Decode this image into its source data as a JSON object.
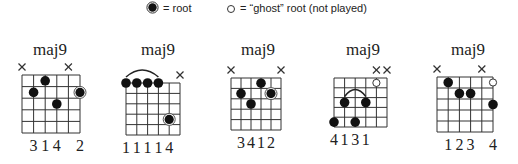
{
  "legend": {
    "root_label": "= root",
    "ghost_label": "= “ghost” root (not played)"
  },
  "chords": [
    {
      "title": "maj9",
      "muted": [
        1,
        5
      ],
      "dots": [
        {
          "string": 2,
          "fret": 2
        },
        {
          "string": 3,
          "fret": 1
        },
        {
          "string": 4,
          "fret": 3
        }
      ],
      "roots": [
        {
          "string": 6,
          "fret": 2
        }
      ],
      "ghosts": [],
      "barre": null,
      "fingering": [
        "",
        "3",
        "1",
        "4",
        "",
        "2"
      ]
    },
    {
      "title": "maj9",
      "muted": [
        6
      ],
      "dots": [
        {
          "string": 1,
          "fret": 0
        },
        {
          "string": 2,
          "fret": 0
        },
        {
          "string": 3,
          "fret": 0
        },
        {
          "string": 4,
          "fret": 0
        }
      ],
      "roots": [
        {
          "string": 5,
          "fret": 4
        }
      ],
      "ghosts": [],
      "barre": {
        "from": 1,
        "to": 4,
        "fret": 0
      },
      "fingering": [
        "1",
        "1",
        "1",
        "1",
        "4",
        ""
      ]
    },
    {
      "title": "maj9",
      "muted": [
        1,
        6
      ],
      "dots": [
        {
          "string": 2,
          "fret": 2
        },
        {
          "string": 3,
          "fret": 3
        },
        {
          "string": 4,
          "fret": 1
        }
      ],
      "roots": [
        {
          "string": 5,
          "fret": 2
        }
      ],
      "ghosts": [],
      "barre": null,
      "fingering": [
        "",
        "3",
        "4",
        "1",
        "2",
        ""
      ]
    },
    {
      "title": "maj9",
      "muted": [
        5,
        6
      ],
      "dots": [
        {
          "string": 1,
          "fret": 5
        },
        {
          "string": 2,
          "fret": 3
        },
        {
          "string": 3,
          "fret": 5
        },
        {
          "string": 4,
          "fret": 3
        }
      ],
      "roots": [],
      "ghosts": [
        {
          "string": 5,
          "fret": 1
        }
      ],
      "barre": {
        "from": 2,
        "to": 4,
        "fret": 3
      },
      "fingering": [
        "4",
        "1",
        "3",
        "1",
        "",
        ""
      ]
    },
    {
      "title": "maj9",
      "muted": [
        1,
        5
      ],
      "dots": [
        {
          "string": 2,
          "fret": 1
        },
        {
          "string": 3,
          "fret": 2
        },
        {
          "string": 4,
          "fret": 2
        },
        {
          "string": 6,
          "fret": 3
        }
      ],
      "roots": [],
      "ghosts": [
        {
          "string": 6,
          "fret": 1
        }
      ],
      "barre": null,
      "fingering": [
        "",
        "1",
        "2",
        "3",
        "",
        "4"
      ]
    }
  ]
}
